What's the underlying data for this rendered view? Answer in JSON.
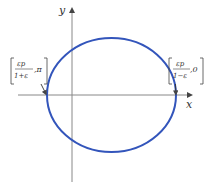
{
  "diagram": {
    "type": "ellipse-polar-conic",
    "axes": {
      "x_label": "x",
      "y_label": "y"
    },
    "ellipse": {
      "color": "#3355bb",
      "stroke_width": 2
    },
    "left_point": {
      "numerator": "εp",
      "denominator": "1+ε",
      "angle": "π"
    },
    "right_point": {
      "numerator": "εp",
      "denominator": "1−ε",
      "angle": "0"
    }
  }
}
